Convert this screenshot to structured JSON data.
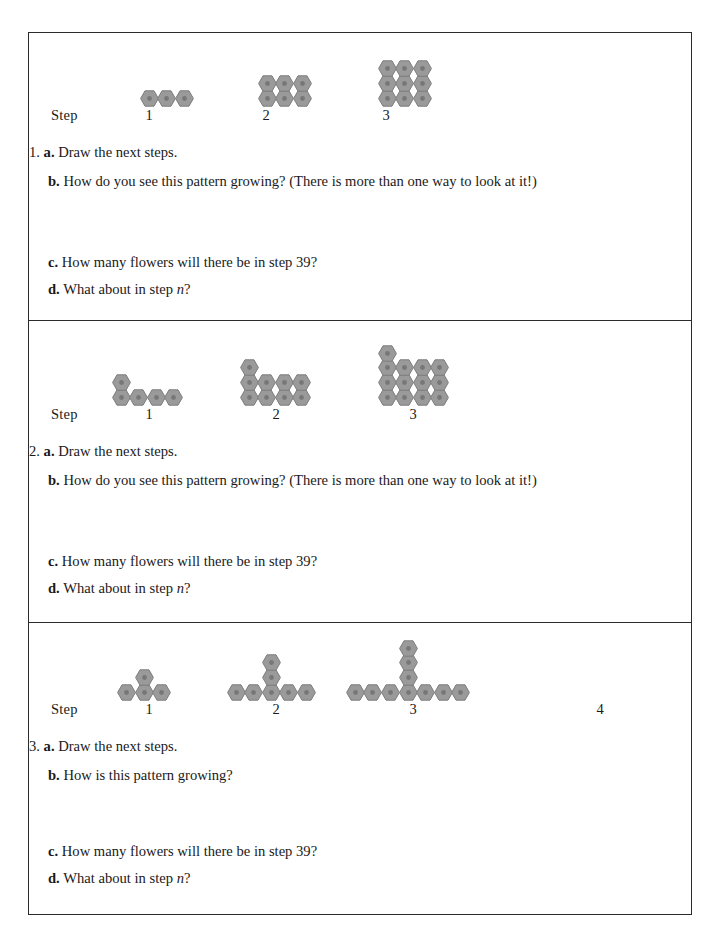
{
  "page": {
    "step_word": "Step",
    "flower_color": "#9a9a9a",
    "flower_edge_color": "#7d7d7d",
    "flower_center_color": "#777777",
    "border_color": "#2b2b2b"
  },
  "problems": [
    {
      "number": "1.",
      "step_labels": [
        "1",
        "2",
        "3"
      ],
      "questions": [
        {
          "letter": "a.",
          "text": "Draw the next steps."
        },
        {
          "letter": "b.",
          "text": "How do you see this pattern growing? (There is more than one way to look at it!)"
        },
        {
          "letter": "c.",
          "text": "How many flowers will there be in step 39?"
        },
        {
          "letter": "d.",
          "text": "What about in step n?",
          "italic_tail": "n?"
        }
      ]
    },
    {
      "number": "2.",
      "step_labels": [
        "1",
        "2",
        "3"
      ],
      "questions": [
        {
          "letter": "a.",
          "text": "Draw the next steps."
        },
        {
          "letter": "b.",
          "text": "How do you see this pattern growing? (There is more than one way to look at it!)"
        },
        {
          "letter": "c.",
          "text": "How many flowers will there be in step 39?"
        },
        {
          "letter": "d.",
          "text": "What about in step n?",
          "italic_tail": "n?"
        }
      ]
    },
    {
      "number": "3.",
      "step_labels": [
        "1",
        "2",
        "3",
        "4"
      ],
      "questions": [
        {
          "letter": "a.",
          "text": "Draw the next steps."
        },
        {
          "letter": "b.",
          "text": "How is this pattern growing?"
        },
        {
          "letter": "c.",
          "text": "How many flowers will there be in step 39?"
        },
        {
          "letter": "d.",
          "text": "What about in step n?",
          "italic_tail": "n?"
        }
      ]
    }
  ],
  "chart_data": {
    "type": "diagram",
    "patterns": [
      {
        "id": 1,
        "description": "Rectangular array 3 wide by n tall",
        "steps": [
          {
            "step": 1,
            "count": 3,
            "rows": [
              3
            ]
          },
          {
            "step": 2,
            "count": 6,
            "rows": [
              3,
              3
            ]
          },
          {
            "step": 3,
            "count": 9,
            "rows": [
              3,
              3,
              3
            ]
          }
        ],
        "rule": "3n"
      },
      {
        "id": 2,
        "description": "Array 4 wide by n tall with one extra flower on top-left",
        "steps": [
          {
            "step": 1,
            "count": 5,
            "rows": [
              4,
              1
            ]
          },
          {
            "step": 2,
            "count": 9,
            "rows": [
              4,
              4,
              1
            ]
          },
          {
            "step": 3,
            "count": 13,
            "rows": [
              4,
              4,
              4,
              1
            ]
          }
        ],
        "rule": "4n + 1"
      },
      {
        "id": 3,
        "description": "T shape: horizontal row of 2n+1 with a stem of n above the center",
        "steps": [
          {
            "step": 1,
            "count": 4,
            "row": 3,
            "stem": 1
          },
          {
            "step": 2,
            "count": 7,
            "row": 5,
            "stem": 2
          },
          {
            "step": 3,
            "count": 10,
            "row": 7,
            "stem": 3
          },
          {
            "step": 4,
            "count": null,
            "row": null,
            "stem": null
          }
        ],
        "rule": "3n + 1"
      }
    ]
  }
}
